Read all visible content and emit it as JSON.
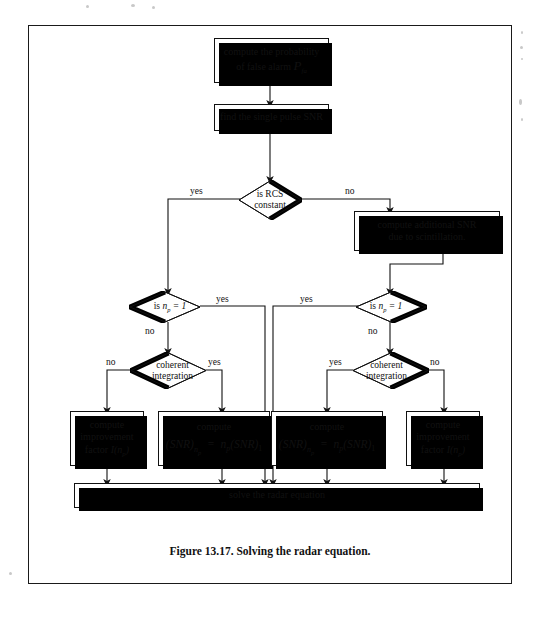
{
  "figure": {
    "caption": "Figure 13.17. Solving the radar equation.",
    "frame_color": "#1a1a1a"
  },
  "nodes": {
    "start": {
      "id": "compute-false-alarm-probability",
      "type": "process",
      "line1": "compute the probability",
      "line2_prefix": "of false alarm ",
      "line2_symbol": "P",
      "line2_subscript": "fa"
    },
    "single_pulse_snr": {
      "id": "find-single-pulse-snr",
      "type": "process",
      "text": "find the single pulse SNR"
    },
    "rcs_decision": {
      "id": "is-rcs-constant",
      "type": "decision",
      "line1": "is RCS",
      "line2": "constant",
      "yes_label": "yes",
      "no_label": "no"
    },
    "scintillation": {
      "id": "compute-additional-snr",
      "type": "process",
      "line1": "compute additional SNR",
      "line2": "due to scintillation."
    },
    "np_left": {
      "id": "is-np-equal-1-left",
      "type": "decision",
      "text_prefix": "is ",
      "symbol": "n",
      "subscript": "p",
      "text_suffix": " = 1",
      "yes_label": "yes",
      "no_label": "no"
    },
    "np_right": {
      "id": "is-np-equal-1-right",
      "type": "decision",
      "text_prefix": "is ",
      "symbol": "n",
      "subscript": "p",
      "text_suffix": " = 1",
      "yes_label": "yes",
      "no_label": "no"
    },
    "coherent_left": {
      "id": "coherent-integration-left",
      "type": "decision",
      "line1": "coherent",
      "line2": "integration",
      "yes_label": "yes",
      "no_label": "no"
    },
    "coherent_right": {
      "id": "coherent-integration-right",
      "type": "decision",
      "line1": "coherent",
      "line2": "integration",
      "yes_label": "yes",
      "no_label": "no"
    },
    "improve_left": {
      "id": "compute-improvement-factor-left",
      "type": "process",
      "line1": "compute",
      "line2": "improvement",
      "line3_prefix": "factor ",
      "line3_symbol": "I(n",
      "line3_subscript": "p",
      "line3_suffix": ")"
    },
    "improve_right": {
      "id": "compute-improvement-factor-right",
      "type": "process",
      "line1": "compute",
      "line2": "improvement",
      "line3_prefix": "factor ",
      "line3_symbol": "I(n",
      "line3_subscript": "p",
      "line3_suffix": ")"
    },
    "snr_left": {
      "id": "compute-snr-np-left",
      "type": "process",
      "line1": "compute",
      "equation": "(SNR)n_p = n_p(SNR)1"
    },
    "snr_right": {
      "id": "compute-snr-np-right",
      "type": "process",
      "line1": "compute",
      "equation": "(SNR)n_p = n_p(SNR)1"
    },
    "solve": {
      "id": "solve-radar-equation",
      "type": "process",
      "text": "solve the radar equation"
    }
  },
  "edge_labels": {
    "rcs_yes": "yes",
    "rcs_no": "no",
    "np_left_yes": "yes",
    "np_left_no": "no",
    "np_right_yes": "yes",
    "np_right_no": "no",
    "coh_left_no": "no",
    "coh_left_yes": "yes",
    "coh_right_yes": "yes",
    "coh_right_no": "no"
  }
}
